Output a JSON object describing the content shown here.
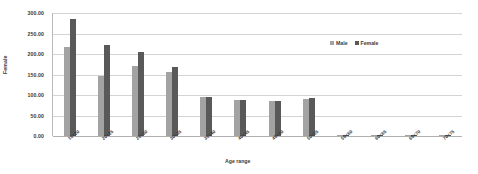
{
  "chart_data": {
    "type": "bar",
    "title": "",
    "xlabel": "Age range",
    "ylabel": "Female",
    "ylim": [
      0,
      300
    ],
    "ytick_step": 50,
    "grid": true,
    "legend_position": "top-right",
    "categories": [
      "15&lt;20",
      "20&lt;25",
      "25&lt;30",
      "30&lt;35",
      "35&lt;40",
      "40&lt;45",
      "45&lt;50",
      "50&lt;55",
      "55&lt;60",
      "60&lt;65",
      "65&lt;70",
      "70&lt;75"
    ],
    "ytick_labels": [
      "0.00",
      "50.00",
      "100.00",
      "150.00",
      "200.00",
      "250.00",
      "300.00"
    ],
    "ytick_values": [
      0,
      50,
      100,
      150,
      200,
      250,
      300
    ],
    "series": [
      {
        "name": "Male",
        "color": "#a3a3a3",
        "values": [
          217,
          147,
          170,
          157,
          95,
          87,
          85,
          90,
          3,
          2,
          2,
          2
        ]
      },
      {
        "name": "Female",
        "color": "#595959",
        "values": [
          285,
          222,
          205,
          168,
          96,
          88,
          86,
          92,
          3,
          2,
          2,
          2
        ]
      }
    ]
  },
  "legend": {
    "items": [
      {
        "label": "Male"
      },
      {
        "label": "Female"
      }
    ]
  }
}
